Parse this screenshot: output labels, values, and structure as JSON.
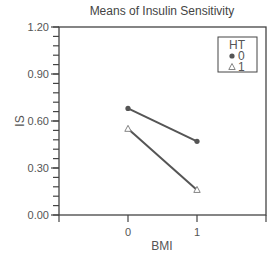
{
  "chart_data": {
    "type": "line",
    "title": "Means of Insulin Sensitivity",
    "xlabel": "BMI",
    "ylabel": "IS",
    "categories": [
      "0",
      "1"
    ],
    "x": [
      0,
      1
    ],
    "xlim": [
      -1,
      2
    ],
    "ylim": [
      0.0,
      1.2
    ],
    "yticks": [
      "0.00",
      "0.30",
      "0.60",
      "0.90",
      "1.20"
    ],
    "ytick_values": [
      0.0,
      0.3,
      0.6,
      0.9,
      1.2
    ],
    "y_minor_step": 0.06,
    "xticks": [
      "0",
      "1"
    ],
    "grid": false,
    "legend": {
      "title": "HT",
      "position": "upper right, inside"
    },
    "series": [
      {
        "name": "0",
        "marker": "filled-circle",
        "values": [
          0.68,
          0.47
        ]
      },
      {
        "name": "1",
        "marker": "open-triangle",
        "values": [
          0.55,
          0.16
        ]
      }
    ],
    "colors": {
      "line": "#555555",
      "axis": "#444444",
      "text": "#555555"
    }
  }
}
